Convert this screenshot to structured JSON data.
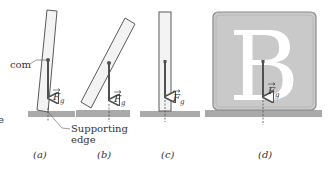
{
  "figure": {
    "colors": {
      "ground": "#a9a9a9",
      "block_fill": "#f3f3f3",
      "block_stroke": "#5a5a5a",
      "arrow": "#505050",
      "box_fill": "#c9c9c9",
      "box_stroke": "#8a8a8a",
      "letter": "#ffffff"
    },
    "labels": {
      "com": "com",
      "force_symbol": "F",
      "force_subscript": "g",
      "supporting_edge_line1": "Supporting",
      "supporting_edge_line2": "edge",
      "panel_cut_letter": "e",
      "box_letter": "B"
    },
    "panels": [
      {
        "id": "a",
        "caption": "(a)"
      },
      {
        "id": "b",
        "caption": "(b)"
      },
      {
        "id": "c",
        "caption": "(c)"
      },
      {
        "id": "d",
        "caption": "(d)"
      }
    ]
  }
}
